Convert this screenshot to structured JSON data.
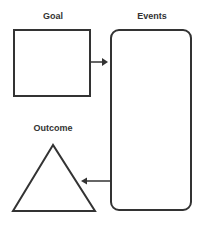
{
  "diagram": {
    "nodes": [
      {
        "id": "goal",
        "label": "Goal",
        "shape": "rectangle"
      },
      {
        "id": "events",
        "label": "Events",
        "shape": "rounded-rectangle"
      },
      {
        "id": "outcome",
        "label": "Outcome",
        "shape": "triangle"
      }
    ],
    "edges": [
      {
        "from": "goal",
        "to": "events"
      },
      {
        "from": "events",
        "to": "outcome"
      }
    ],
    "colors": {
      "stroke": "#333333",
      "background": "#ffffff"
    }
  }
}
